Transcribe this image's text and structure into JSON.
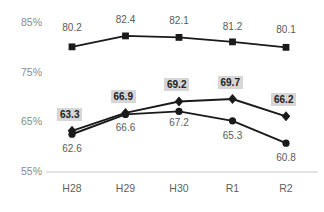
{
  "chart_data": {
    "type": "line",
    "title": "",
    "subtitle": "",
    "xlabel": "",
    "ylabel": "",
    "categories": [
      "H28",
      "H29",
      "H30",
      "R1",
      "R2"
    ],
    "ylim": [
      55,
      85
    ],
    "yticks": [
      "55%",
      "65%",
      "75%",
      "85%"
    ],
    "ytick_values": [
      55,
      65,
      75,
      85
    ],
    "grid": false,
    "baseline_gridline": true,
    "legend_position": "none",
    "series": [
      {
        "name": "series-squares",
        "marker": "square",
        "values": [
          80.2,
          82.4,
          82.1,
          81.2,
          80.1
        ],
        "labels": [
          "80.2",
          "82.4",
          "82.1",
          "81.2",
          "80.1"
        ],
        "label_position": "above",
        "label_highlight": false,
        "color": "#1a1a1a"
      },
      {
        "name": "series-diamonds",
        "marker": "diamond",
        "values": [
          63.3,
          66.9,
          69.2,
          69.7,
          66.2
        ],
        "labels": [
          "63.3",
          "66.9",
          "69.2",
          "69.7",
          "66.2"
        ],
        "label_position": "above",
        "label_highlight": true,
        "color": "#1a1a1a"
      },
      {
        "name": "series-circles",
        "marker": "circle",
        "values": [
          62.6,
          66.6,
          67.2,
          65.3,
          60.8
        ],
        "labels": [
          "62.6",
          "66.6",
          "67.2",
          "65.3",
          "60.8"
        ],
        "label_position": "below",
        "label_highlight": false,
        "color": "#1a1a1a"
      }
    ],
    "colors": {
      "line": "#1a1a1a",
      "axis_text": "#8a8a8a",
      "label_text": "#5a5a5a",
      "highlight_bg": "#d6d6d6",
      "baseline": "#c8c8c8",
      "background": "#ffffff"
    }
  }
}
